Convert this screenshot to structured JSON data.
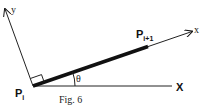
{
  "figure": {
    "caption": "Fig. 6",
    "origin_label": {
      "base": "P",
      "sub": "i"
    },
    "end_label": {
      "base": "P",
      "sub": "i+1"
    },
    "angle_label": "θ",
    "global_axis_label": "X",
    "local_x_label": "x",
    "local_y_label": "y",
    "colors": {
      "line": "#111111",
      "background": "#ffffff"
    }
  }
}
